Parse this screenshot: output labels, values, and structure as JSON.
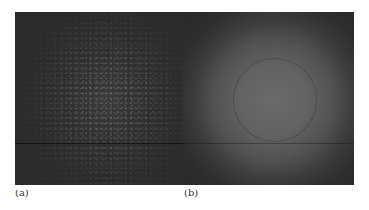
{
  "figure": {
    "panels": [
      {
        "id": "a",
        "label": "(a)",
        "description": "dark speckle-pattern image with faint granular bright spots concentrated in the center",
        "background_color": "#2b2b2b"
      },
      {
        "id": "b",
        "label": "(b)",
        "description": "smooth radially-bright disk image with a dotted circular region of interest overlay",
        "center_color": "#6a6a6a",
        "edge_color": "#282828",
        "overlay": {
          "shape": "dotted-circle",
          "color": "#3a3a3a"
        }
      }
    ]
  }
}
